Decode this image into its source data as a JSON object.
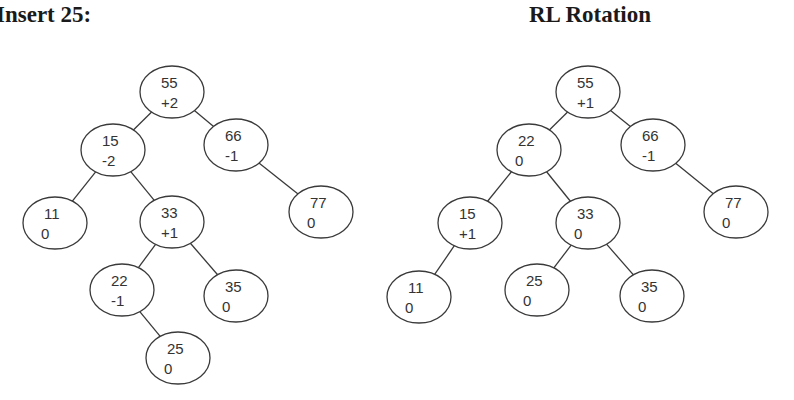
{
  "left_panel": {
    "title": "Insert 25:",
    "nodes": [
      {
        "id": "L55",
        "key": "55",
        "balance": "+2",
        "cx": 172,
        "cy": 92
      },
      {
        "id": "L15",
        "key": "15",
        "balance": "-2",
        "cx": 113,
        "cy": 150
      },
      {
        "id": "L66",
        "key": "66",
        "balance": "-1",
        "cx": 236,
        "cy": 145
      },
      {
        "id": "L11",
        "key": "11",
        "balance": "0",
        "cx": 55,
        "cy": 223
      },
      {
        "id": "L33",
        "key": "33",
        "balance": "+1",
        "cx": 172,
        "cy": 222
      },
      {
        "id": "L77",
        "key": "77",
        "balance": "0",
        "cx": 321,
        "cy": 212
      },
      {
        "id": "L22",
        "key": "22",
        "balance": "-1",
        "cx": 122,
        "cy": 290
      },
      {
        "id": "L35",
        "key": "35",
        "balance": "0",
        "cx": 236,
        "cy": 296
      },
      {
        "id": "L25",
        "key": "25",
        "balance": "0",
        "cx": 178,
        "cy": 358
      }
    ],
    "edges": [
      [
        "L55",
        "L15"
      ],
      [
        "L55",
        "L66"
      ],
      [
        "L15",
        "L11"
      ],
      [
        "L15",
        "L33"
      ],
      [
        "L66",
        "L77"
      ],
      [
        "L33",
        "L22"
      ],
      [
        "L33",
        "L35"
      ],
      [
        "L22",
        "L25"
      ]
    ]
  },
  "right_panel": {
    "title": "RL Rotation",
    "nodes": [
      {
        "id": "R55",
        "key": "55",
        "balance": "+1",
        "cx": 588,
        "cy": 92
      },
      {
        "id": "R22",
        "key": "22",
        "balance": "0",
        "cx": 529,
        "cy": 150
      },
      {
        "id": "R66",
        "key": "66",
        "balance": "-1",
        "cx": 653,
        "cy": 145
      },
      {
        "id": "R15",
        "key": "15",
        "balance": "+1",
        "cx": 470,
        "cy": 223
      },
      {
        "id": "R33",
        "key": "33",
        "balance": "0",
        "cx": 588,
        "cy": 223
      },
      {
        "id": "R77",
        "key": "77",
        "balance": "0",
        "cx": 736,
        "cy": 212
      },
      {
        "id": "R11",
        "key": "11",
        "balance": "0",
        "cx": 419,
        "cy": 297
      },
      {
        "id": "R25",
        "key": "25",
        "balance": "0",
        "cx": 537,
        "cy": 290
      },
      {
        "id": "R35",
        "key": "35",
        "balance": "0",
        "cx": 652,
        "cy": 296
      }
    ],
    "edges": [
      [
        "R55",
        "R22"
      ],
      [
        "R55",
        "R66"
      ],
      [
        "R22",
        "R15"
      ],
      [
        "R22",
        "R33"
      ],
      [
        "R66",
        "R77"
      ],
      [
        "R15",
        "R11"
      ],
      [
        "R33",
        "R25"
      ],
      [
        "R33",
        "R35"
      ]
    ]
  },
  "style": {
    "stroke": "#3a3a3a",
    "text": "#333333",
    "node_rx": 32,
    "node_ry": 26
  }
}
